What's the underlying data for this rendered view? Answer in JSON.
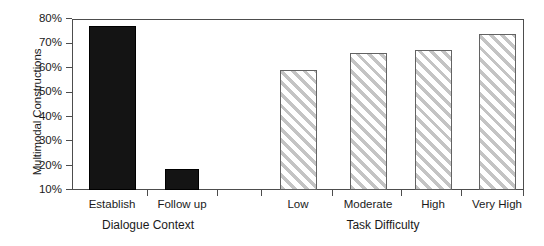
{
  "chart_data": {
    "type": "bar",
    "title": "",
    "subtitle": "",
    "xlabel": "",
    "ylabel": "Multimodal Constructions",
    "ylim": [
      10,
      80
    ],
    "ytick_labels": [
      "80%",
      "70%",
      "60%",
      "50%",
      "40%",
      "30%",
      "20%",
      "10%"
    ],
    "ytick_values": [
      80,
      70,
      60,
      50,
      40,
      30,
      20,
      10
    ],
    "grid": false,
    "legend": "none",
    "categories": [
      "Establish",
      "Follow up",
      "Low",
      "Moderate",
      "High",
      "Very High"
    ],
    "values": [
      77,
      18.5,
      59,
      66,
      67.5,
      74
    ],
    "groups": [
      {
        "label": "Dialogue Context",
        "categories": [
          "Establish",
          "Follow up"
        ],
        "values": [
          77,
          18.5
        ],
        "style": "solid-black"
      },
      {
        "label": "Task Difficulty",
        "categories": [
          "Low",
          "Moderate",
          "High",
          "Very High"
        ],
        "values": [
          59,
          66,
          67.5,
          74
        ],
        "style": "diagonal-hatch"
      }
    ],
    "bars": [
      {
        "label": "Establish",
        "value": 77,
        "group": "Dialogue Context",
        "style": "solid-black"
      },
      {
        "label": "Follow up",
        "value": 18.5,
        "group": "Dialogue Context",
        "style": "solid-black"
      },
      {
        "label": "Low",
        "value": 59,
        "group": "Task Difficulty",
        "style": "diagonal-hatch"
      },
      {
        "label": "Moderate",
        "value": 66,
        "group": "Task Difficulty",
        "style": "diagonal-hatch"
      },
      {
        "label": "High",
        "value": 67.5,
        "group": "Task Difficulty",
        "style": "diagonal-hatch"
      },
      {
        "label": "Very High",
        "value": 74,
        "group": "Task Difficulty",
        "style": "diagonal-hatch"
      }
    ],
    "colors": {
      "solid_bar": "#141414",
      "hatch_line": "#c4c4c4",
      "hatch_background": "#ffffff",
      "bar_border": "#636363",
      "axis": "#4d4d4d",
      "text": "#1a1a1a",
      "plot_background": "#ffffff"
    }
  }
}
